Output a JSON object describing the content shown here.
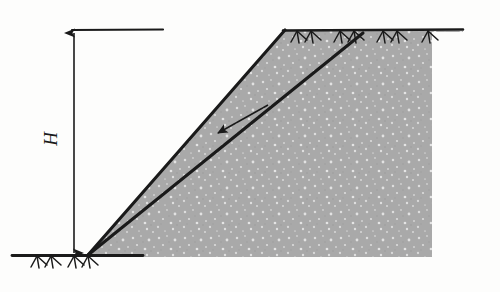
{
  "figure": {
    "type": "engineering-diagram",
    "background_color": "#fdfdfc",
    "ink_color": "#1a1a1a",
    "soil_fill_color": "#a9a9a9",
    "soil_speckle_color": "#d8d8d8",
    "labels": {
      "height": "H"
    },
    "geometry": {
      "toe": [
        88,
        255
      ],
      "crest": [
        285,
        31
      ],
      "slip_exit": [
        362,
        33
      ],
      "ground_right": [
        463,
        30
      ],
      "soil_right_edge": [
        432,
        257
      ],
      "base_line_left": [
        12,
        255
      ],
      "base_line_right": [
        143,
        255
      ],
      "dimension_line_x": 74,
      "dimension_top_y": 30,
      "dimension_bottom_y": 256,
      "extension_line_top": [
        72,
        30,
        163,
        30
      ]
    },
    "annotations": {
      "movement_arrow": {
        "name": "movement-direction-arrow",
        "from": [
          266,
          106
        ],
        "to": [
          216,
          134
        ]
      },
      "ground_hatch_top_count": 4,
      "ground_hatch_base_count": 2
    }
  }
}
